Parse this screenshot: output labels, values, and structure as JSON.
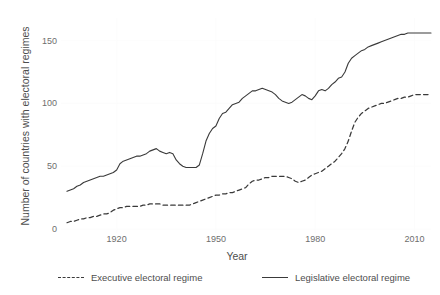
{
  "chart_data": {
    "type": "line",
    "title": "",
    "xlabel": "Year",
    "ylabel": "Number of countries with electoral regimes",
    "xlim": [
      1905,
      2015
    ],
    "ylim": [
      0,
      168
    ],
    "xticks": [
      1920,
      1950,
      1980,
      2010
    ],
    "yticks": [
      0,
      50,
      100,
      150
    ],
    "grid": "faint",
    "legend_position": "bottom",
    "x": [
      1905,
      1906,
      1907,
      1908,
      1909,
      1910,
      1911,
      1912,
      1913,
      1914,
      1915,
      1916,
      1917,
      1918,
      1919,
      1920,
      1921,
      1922,
      1923,
      1924,
      1925,
      1926,
      1927,
      1928,
      1929,
      1930,
      1931,
      1932,
      1933,
      1934,
      1935,
      1936,
      1937,
      1938,
      1939,
      1940,
      1941,
      1942,
      1943,
      1944,
      1945,
      1946,
      1947,
      1948,
      1949,
      1950,
      1951,
      1952,
      1953,
      1954,
      1955,
      1956,
      1957,
      1958,
      1959,
      1960,
      1961,
      1962,
      1963,
      1964,
      1965,
      1966,
      1967,
      1968,
      1969,
      1970,
      1971,
      1972,
      1973,
      1974,
      1975,
      1976,
      1977,
      1978,
      1979,
      1980,
      1981,
      1982,
      1983,
      1984,
      1985,
      1986,
      1987,
      1988,
      1989,
      1990,
      1991,
      1992,
      1993,
      1994,
      1995,
      1996,
      1997,
      1998,
      1999,
      2000,
      2001,
      2002,
      2003,
      2004,
      2005,
      2006,
      2007,
      2008,
      2009,
      2010,
      2011,
      2012,
      2013,
      2014,
      2015
    ],
    "series": [
      {
        "name": "Executive electoral regime",
        "style": "dashed",
        "color": "#3a3a3a",
        "values": [
          5,
          6,
          6,
          7,
          8,
          8,
          9,
          9,
          10,
          10,
          11,
          12,
          12,
          13,
          15,
          16,
          17,
          17,
          18,
          18,
          18,
          18,
          18,
          19,
          19,
          20,
          20,
          20,
          20,
          19,
          19,
          19,
          19,
          19,
          19,
          19,
          19,
          19,
          20,
          21,
          22,
          23,
          24,
          25,
          26,
          27,
          27,
          28,
          28,
          29,
          29,
          30,
          31,
          32,
          33,
          36,
          38,
          39,
          39,
          40,
          41,
          41,
          42,
          42,
          42,
          42,
          42,
          41,
          40,
          38,
          37,
          38,
          39,
          41,
          43,
          44,
          45,
          46,
          48,
          50,
          52,
          54,
          57,
          60,
          64,
          70,
          78,
          85,
          89,
          92,
          94,
          96,
          97,
          98,
          99,
          100,
          100,
          101,
          102,
          103,
          104,
          104,
          105,
          105,
          106,
          107,
          107,
          107,
          107,
          107,
          107
        ]
      },
      {
        "name": "Legislative electoral regime",
        "style": "solid",
        "color": "#3a3a3a",
        "values": [
          30,
          31,
          32,
          34,
          35,
          37,
          38,
          39,
          40,
          41,
          42,
          42,
          43,
          44,
          45,
          47,
          52,
          54,
          55,
          56,
          57,
          58,
          58,
          59,
          60,
          62,
          63,
          64,
          62,
          61,
          60,
          61,
          60,
          55,
          52,
          50,
          49,
          49,
          49,
          49,
          51,
          60,
          70,
          76,
          80,
          82,
          88,
          92,
          93,
          96,
          99,
          100,
          101,
          104,
          106,
          108,
          110,
          110,
          111,
          112,
          111,
          110,
          109,
          107,
          104,
          102,
          101,
          100,
          101,
          103,
          105,
          107,
          106,
          104,
          103,
          106,
          110,
          111,
          110,
          112,
          115,
          117,
          120,
          121,
          125,
          132,
          136,
          138,
          140,
          142,
          143,
          145,
          146,
          147,
          148,
          149,
          150,
          151,
          152,
          153,
          154,
          155,
          155,
          156,
          156,
          156,
          156,
          156,
          156,
          156,
          156
        ]
      }
    ]
  },
  "axis": {
    "ylabel": "Number of countries with electoral regimes",
    "xlabel": "Year",
    "yticks": [
      "150",
      "100",
      "50",
      "0"
    ],
    "xticks": [
      "1920",
      "1950",
      "1980",
      "2010"
    ]
  },
  "legend": {
    "executive_label": "Executive electoral regime",
    "legislative_label": "Legislative electoral regime"
  }
}
